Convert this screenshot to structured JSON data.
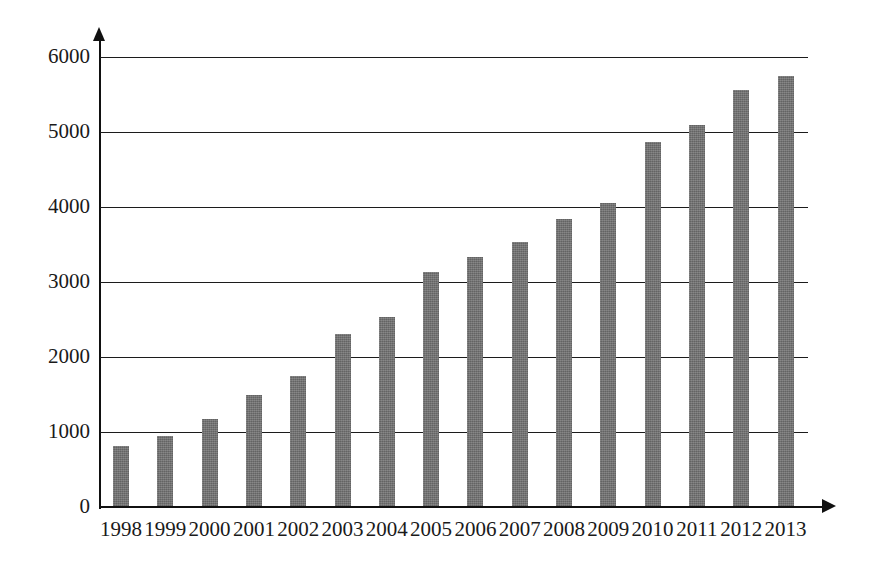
{
  "chart_data": {
    "type": "bar",
    "title": "",
    "subtitle": "",
    "xlabel": "",
    "ylabel": "",
    "categories": [
      "1998",
      "1999",
      "2000",
      "2001",
      "2002",
      "2003",
      "2004",
      "2005",
      "2006",
      "2007",
      "2008",
      "2009",
      "2010",
      "2011",
      "2012",
      "2013"
    ],
    "values": [
      810,
      950,
      1180,
      1500,
      1750,
      2310,
      2530,
      3140,
      3340,
      3530,
      3840,
      4050,
      4870,
      5090,
      5560,
      5750
    ],
    "series": [
      {
        "name": "",
        "values": [
          810,
          950,
          1180,
          1500,
          1750,
          2310,
          2530,
          3140,
          3340,
          3530,
          3840,
          4050,
          4870,
          5090,
          5560,
          5750
        ]
      }
    ],
    "ylim": [
      0,
      6000
    ],
    "y_ticks": [
      0,
      1000,
      2000,
      3000,
      4000,
      5000,
      6000
    ],
    "y_tick_labels": [
      "0",
      "1000",
      "2000",
      "3000",
      "4000",
      "5000",
      "6000"
    ],
    "grid": true,
    "grid_axis": "y",
    "legend": false,
    "legend_position": "none",
    "bar_color": "#6f6f6f",
    "axis_color": "#111111",
    "background_color": "#ffffff",
    "axis_arrows": true
  }
}
